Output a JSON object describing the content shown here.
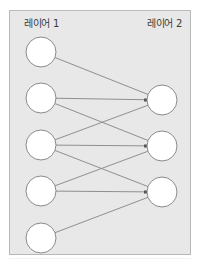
{
  "diagram": {
    "layers": [
      {
        "label": "레이어 1",
        "node_count": 5
      },
      {
        "label": "레이어 2",
        "node_count": 3
      }
    ],
    "connections": [
      {
        "from": 0,
        "to": 0
      },
      {
        "from": 1,
        "to": 0
      },
      {
        "from": 1,
        "to": 1
      },
      {
        "from": 2,
        "to": 0
      },
      {
        "from": 2,
        "to": 1
      },
      {
        "from": 2,
        "to": 2
      },
      {
        "from": 3,
        "to": 1
      },
      {
        "from": 3,
        "to": 2
      },
      {
        "from": 4,
        "to": 2
      }
    ],
    "colors": {
      "background": "#e8e8e8",
      "node_fill": "#ffffff",
      "node_stroke": "#8a8a8a",
      "edge": "#8f8f8f"
    }
  }
}
